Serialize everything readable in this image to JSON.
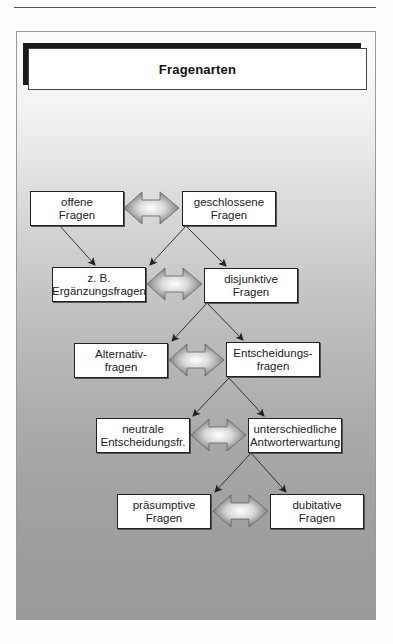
{
  "header": {
    "running_title": "Die Kunst des Fragens und Antwortens",
    "page_number": "29"
  },
  "diagram": {
    "title": "Fragenarten",
    "rows": [
      {
        "left": {
          "line1": "offene",
          "line2": "Fragen"
        },
        "right": {
          "line1": "geschlossene",
          "line2": "Fragen"
        }
      },
      {
        "left": {
          "line1": "z. B.",
          "line2": "Ergänzungsfragen"
        },
        "right": {
          "line1": "disjunktive",
          "line2": "Fragen"
        }
      },
      {
        "left": {
          "line1": "Alternativ-",
          "line2": "fragen"
        },
        "right": {
          "line1": "Entscheidungs-",
          "line2": "fragen"
        }
      },
      {
        "left": {
          "line1": "neutrale",
          "line2": "Entscheidungsfr."
        },
        "right": {
          "line1": "unterschiedliche",
          "line2": "Antworterwartung"
        }
      },
      {
        "left": {
          "line1": "präsumptive",
          "line2": "Fragen"
        },
        "right": {
          "line1": "dubitative",
          "line2": "Fragen"
        }
      }
    ],
    "connector_icon": "double-arrow-icon",
    "colors": {
      "box_fill": "#ffffff",
      "box_border": "#222222",
      "title_shadow": "#1a1a1a",
      "panel_top": "#fbfbfb",
      "panel_bottom": "#9a9a9a",
      "arrow_center": "#ffffff",
      "arrow_edge": "#6f6f6f"
    }
  }
}
